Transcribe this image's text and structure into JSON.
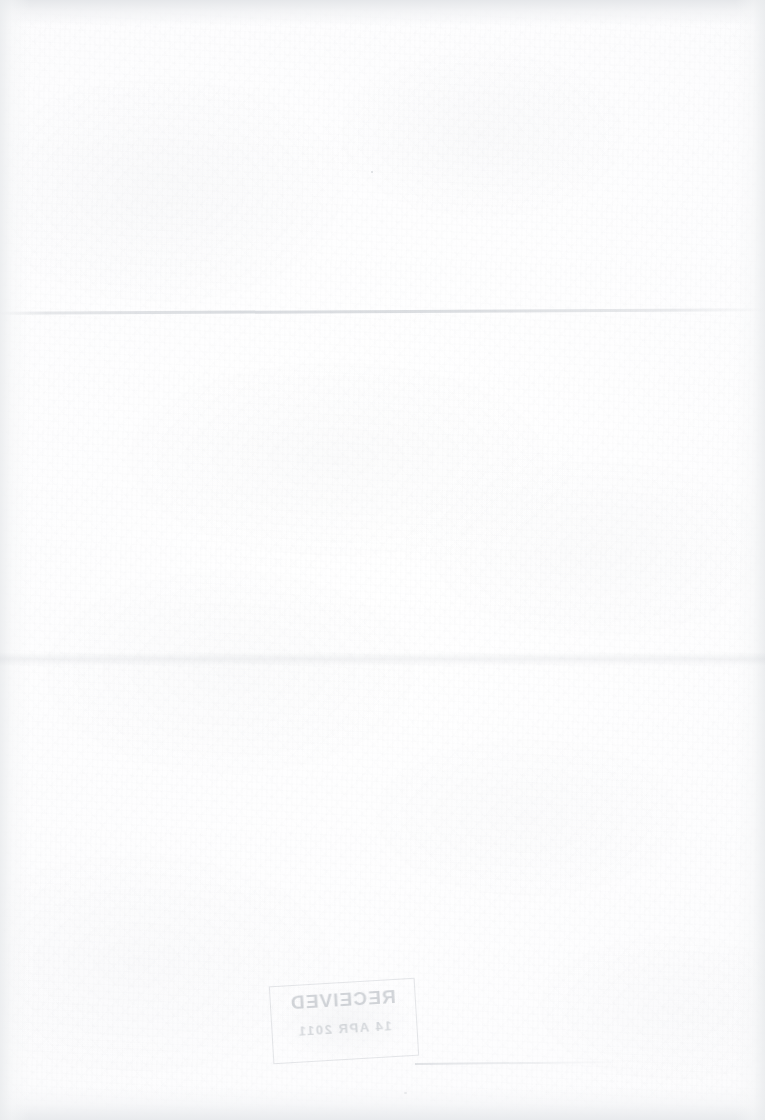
{
  "document": {
    "kind": "scanned-page",
    "page_state": "blank",
    "width_px": 765,
    "height_px": 1120,
    "background_color": "#fdfdfd",
    "body_text": ""
  },
  "stamp": {
    "name": "received-date-stamp",
    "orientation": "mirrored-bleed-through",
    "title": "RECEIVED",
    "date": "14 APR 2011",
    "footer": "",
    "ink_color": "#969da6",
    "rotation_deg": -3.4
  },
  "artifacts": {
    "crease_label": "",
    "edge_shading_color": "#eaecee",
    "top_band_color": "#f0f1f2"
  }
}
